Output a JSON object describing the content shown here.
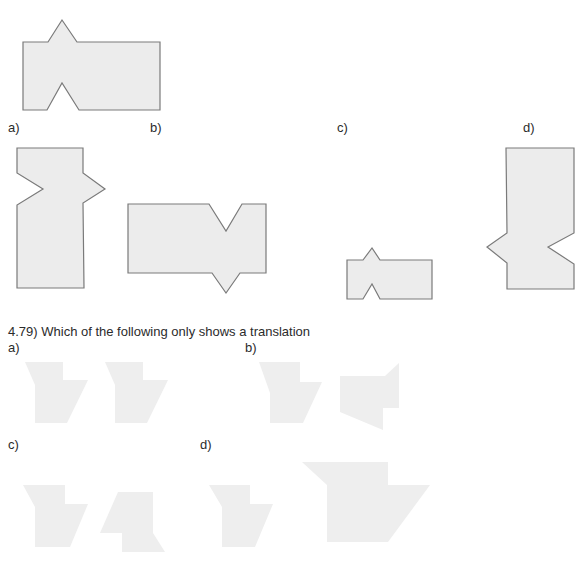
{
  "question_4_78": {
    "options": [
      {
        "label": "a)"
      },
      {
        "label": "b)"
      },
      {
        "label": "c)"
      },
      {
        "label": "d)"
      }
    ]
  },
  "question_4_79": {
    "prompt": "4.79) Which of the following only shows a translation",
    "options": [
      {
        "label": "a)"
      },
      {
        "label": "b)"
      },
      {
        "label": "c)"
      },
      {
        "label": "d)"
      }
    ]
  },
  "colors": {
    "shape_fill": "#ececec",
    "shape_outline": "#7a7a7a",
    "faint_fill": "#eeeeee"
  }
}
